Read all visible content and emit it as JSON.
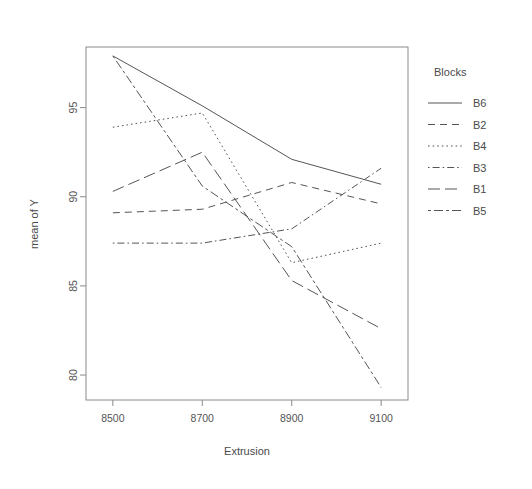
{
  "chart_data": {
    "type": "line",
    "title": "",
    "xlabel": "Extrusion",
    "ylabel": "mean of Y",
    "categories": [
      "8500",
      "8700",
      "8900",
      "9100"
    ],
    "x": [
      8500,
      8700,
      8900,
      9100
    ],
    "xtick_labels": [
      "8500",
      "8700",
      "8900",
      "9100"
    ],
    "ytick_labels": [
      "80",
      "85",
      "90",
      "95"
    ],
    "yticks": [
      80,
      85,
      90,
      95
    ],
    "ylim": [
      78.6,
      98.4
    ],
    "xlim": [
      8440,
      9160
    ],
    "grid": false,
    "legend_position": "right",
    "legend_title": "Blocks",
    "series": [
      {
        "name": "B6",
        "linestyle": "solid",
        "values": [
          97.9,
          95.1,
          92.1,
          90.7
        ]
      },
      {
        "name": "B2",
        "linestyle": "dashed",
        "values": [
          89.1,
          89.3,
          90.8,
          89.6
        ]
      },
      {
        "name": "B4",
        "linestyle": "dotted",
        "values": [
          93.9,
          94.7,
          86.3,
          87.4
        ]
      },
      {
        "name": "B3",
        "linestyle": "dotdash",
        "values": [
          87.4,
          87.4,
          88.2,
          91.6
        ]
      },
      {
        "name": "B1",
        "linestyle": "longdash",
        "values": [
          90.3,
          92.5,
          85.3,
          82.6
        ]
      },
      {
        "name": "B5",
        "linestyle": "twodash",
        "values": [
          97.9,
          90.6,
          87.2,
          79.3
        ]
      }
    ]
  },
  "legend": {
    "title": "Blocks",
    "entries": [
      {
        "label": "B6"
      },
      {
        "label": "B2"
      },
      {
        "label": "B4"
      },
      {
        "label": "B3"
      },
      {
        "label": "B1"
      },
      {
        "label": "B5"
      }
    ]
  },
  "axes": {
    "x_title": "Extrusion",
    "y_title": "mean of Y",
    "x_ticks": [
      "8500",
      "8700",
      "8900",
      "9100"
    ],
    "y_ticks": [
      "80",
      "85",
      "90",
      "95"
    ]
  },
  "colors": {
    "line": "#555555",
    "axis": "#8a8a8a",
    "text": "#4a4a4a",
    "background": "#ffffff"
  }
}
